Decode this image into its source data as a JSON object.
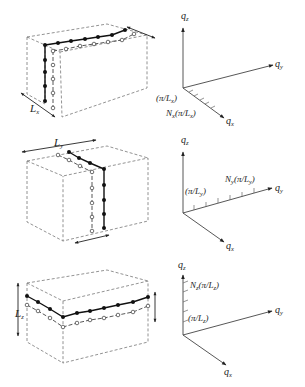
{
  "figure": {
    "panels": [
      {
        "id": "x",
        "box_dimension_label": "L",
        "box_dimension_sub": "x",
        "axes": {
          "z": "q",
          "z_sub": "z",
          "y": "q",
          "y_sub": "y",
          "x": "q",
          "x_sub": "x"
        },
        "first_mode_label": "(π/L",
        "first_mode_sub": "x",
        "first_mode_close": ")",
        "nth_mode_prefix": "N",
        "nth_mode_prefix_sub": "x",
        "nth_mode_body": "(π/L",
        "nth_mode_sub": "x",
        "nth_mode_close": ")",
        "atoms_per_chain": 7
      },
      {
        "id": "y",
        "box_dimension_label": "L",
        "box_dimension_sub": "y",
        "axes": {
          "z": "q",
          "z_sub": "z",
          "y": "q",
          "y_sub": "y",
          "x": "q",
          "x_sub": "x"
        },
        "first_mode_label": "(π/L",
        "first_mode_sub": "y",
        "first_mode_close": ")",
        "nth_mode_prefix": "N",
        "nth_mode_prefix_sub": "y",
        "nth_mode_body": "(π/L",
        "nth_mode_sub": "y",
        "nth_mode_close": ")",
        "atoms_per_chain": 7
      },
      {
        "id": "z",
        "box_dimension_label": "L",
        "box_dimension_sub": "z",
        "axes": {
          "z": "q",
          "z_sub": "z",
          "y": "q",
          "y_sub": "y",
          "x": "q",
          "x_sub": "x"
        },
        "first_mode_label": "(π/L",
        "first_mode_sub": "z",
        "first_mode_close": ")",
        "nth_mode_prefix": "N",
        "nth_mode_prefix_sub": "z",
        "nth_mode_body": "(π/L",
        "nth_mode_sub": "z",
        "nth_mode_close": ")",
        "atoms_per_chain": 9
      }
    ]
  }
}
